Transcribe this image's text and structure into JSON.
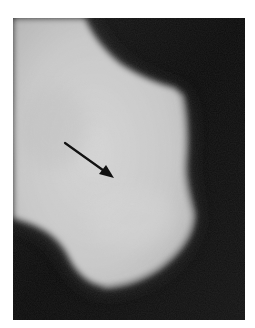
{
  "image": {
    "type": "radiograph",
    "subject": "bone (lateral view)",
    "alt": "Radiograph of a bone with a black arrow pointing to a region in its center",
    "colors": {
      "background": "#0b0b0b",
      "bone_bright": "#d8d8d8",
      "bone_mid": "#bdbdbd",
      "page": "#ffffff",
      "arrow": "#111111"
    },
    "annotations": [
      {
        "kind": "arrow",
        "from": [
          52,
          125
        ],
        "to": [
          101,
          160
        ],
        "color": "#111111"
      }
    ]
  }
}
